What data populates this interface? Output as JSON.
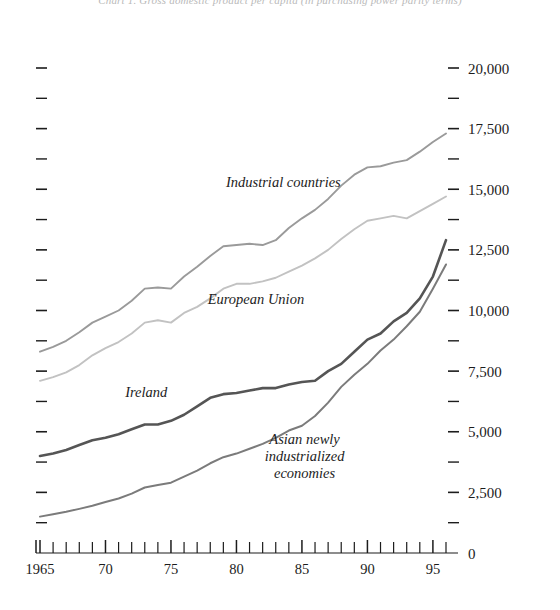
{
  "chart_data": {
    "type": "line",
    "title": "Chart 1.  Gross domestic product per capita (in purchasing power parity terms)",
    "subtitle": "",
    "xlabel": "",
    "ylabel": "",
    "grid": false,
    "legend_position": "inline-labels",
    "xlim": [
      1965,
      1996
    ],
    "ylim": [
      0,
      20000
    ],
    "y_ticks_major": [
      0,
      2500,
      5000,
      7500,
      10000,
      12500,
      15000,
      17500,
      20000
    ],
    "y_tick_labels": [
      "0",
      "2,500",
      "5,000",
      "7,500",
      "10,000",
      "12,500",
      "15,000",
      "17,500",
      "20,000"
    ],
    "y_minor_interval": 1250,
    "x_ticks_major": [
      1965,
      1970,
      1975,
      1980,
      1985,
      1990,
      1995
    ],
    "x_tick_labels": [
      "1965",
      "70",
      "75",
      "80",
      "85",
      "90",
      "95"
    ],
    "x_minor_interval": 1,
    "x": [
      1965,
      1966,
      1967,
      1968,
      1969,
      1970,
      1971,
      1972,
      1973,
      1974,
      1975,
      1976,
      1977,
      1978,
      1979,
      1980,
      1981,
      1982,
      1983,
      1984,
      1985,
      1986,
      1987,
      1988,
      1989,
      1990,
      1991,
      1992,
      1993,
      1994,
      1995,
      1996
    ],
    "series": [
      {
        "name": "Industrial countries",
        "color": "#9a9a9a",
        "width": 1.9,
        "label_x": 1979.2,
        "label_y": 15100,
        "values": [
          8300,
          8500,
          8750,
          9100,
          9500,
          9750,
          10000,
          10400,
          10900,
          10950,
          10900,
          11400,
          11800,
          12250,
          12650,
          12700,
          12750,
          12700,
          12900,
          13400,
          13800,
          14150,
          14600,
          15150,
          15600,
          15900,
          15950,
          16100,
          16200,
          16550,
          16950,
          17300
        ]
      },
      {
        "name": "European Union",
        "color": "#c2c2c2",
        "width": 1.9,
        "label_x": 1977.8,
        "label_y": 10250,
        "values": [
          7100,
          7250,
          7450,
          7750,
          8150,
          8450,
          8700,
          9050,
          9500,
          9600,
          9500,
          9900,
          10150,
          10500,
          10900,
          11100,
          11100,
          11200,
          11350,
          11600,
          11850,
          12150,
          12500,
          12950,
          13350,
          13700,
          13800,
          13900,
          13800,
          14100,
          14400,
          14700
        ]
      },
      {
        "name": "Ireland",
        "color": "#555555",
        "width": 2.6,
        "label_x": 1971.5,
        "label_y": 6450,
        "values": [
          4000,
          4100,
          4250,
          4450,
          4650,
          4750,
          4900,
          5100,
          5300,
          5300,
          5450,
          5700,
          6050,
          6400,
          6550,
          6600,
          6700,
          6800,
          6800,
          6950,
          7050,
          7100,
          7500,
          7800,
          8300,
          8800,
          9050,
          9550,
          9900,
          10500,
          11400,
          12900
        ]
      },
      {
        "name": "Asian newly industrialized economies",
        "color": "#7b7b7b",
        "width": 2.0,
        "label_x": 1985.2,
        "label_y": 4500,
        "values": [
          1500,
          1600,
          1700,
          1820,
          1950,
          2100,
          2250,
          2450,
          2700,
          2800,
          2900,
          3150,
          3400,
          3700,
          3950,
          4100,
          4300,
          4500,
          4750,
          5050,
          5250,
          5650,
          6200,
          6850,
          7350,
          7800,
          8350,
          8800,
          9350,
          9950,
          10900,
          11900
        ]
      }
    ]
  },
  "axes": {
    "left_axis_name": "left-minor-tick-axis",
    "right_axis_name": "right-value-axis",
    "bottom_axis_name": "bottom-year-axis",
    "zero_label": "0"
  }
}
